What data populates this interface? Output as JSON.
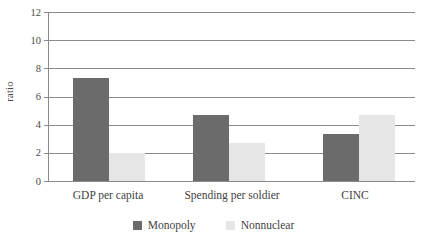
{
  "chart_data": {
    "type": "bar",
    "title": "",
    "subtitle": "",
    "xlabel": "",
    "ylabel": "ratio",
    "categories": [
      "GDP per capita",
      "Spending per soldier",
      "CINC"
    ],
    "series": [
      {
        "name": "Monopoly",
        "color": "#6b6b6b",
        "values": [
          7.3,
          4.7,
          3.35
        ]
      },
      {
        "name": "Nonnuclear",
        "color": "#e6e6e6",
        "values": [
          2.0,
          2.7,
          4.7
        ]
      }
    ],
    "ylim": [
      0,
      12
    ],
    "ytick_values": [
      0,
      2,
      4,
      6,
      8,
      10,
      12
    ],
    "ytick_labels": [
      "0",
      "2",
      "4",
      "6",
      "8",
      "10",
      "12"
    ],
    "grid": "horizontal",
    "legend_position": "bottom-center",
    "annotations": []
  },
  "axis": {
    "y_title": "ratio",
    "ticks": [
      {
        "value": 12,
        "label": "12"
      },
      {
        "value": 10,
        "label": "10"
      },
      {
        "value": 8,
        "label": "8"
      },
      {
        "value": 6,
        "label": "6"
      },
      {
        "value": 4,
        "label": "4"
      },
      {
        "value": 2,
        "label": "2"
      },
      {
        "value": 0,
        "label": "0"
      }
    ]
  },
  "categories": [
    {
      "label": "GDP per capita"
    },
    {
      "label": "Spending per soldier"
    },
    {
      "label": "CINC"
    }
  ],
  "legend": {
    "items": [
      {
        "label": "Monopoly",
        "color": "#6b6b6b"
      },
      {
        "label": "Nonnuclear",
        "color": "#e6e6e6"
      }
    ]
  },
  "colors": {
    "monopoly": "#6b6b6b",
    "nonnuclear": "#e6e6e6",
    "grid": "#8a8a8a",
    "text": "#3f3f3f",
    "background": "#ffffff"
  }
}
